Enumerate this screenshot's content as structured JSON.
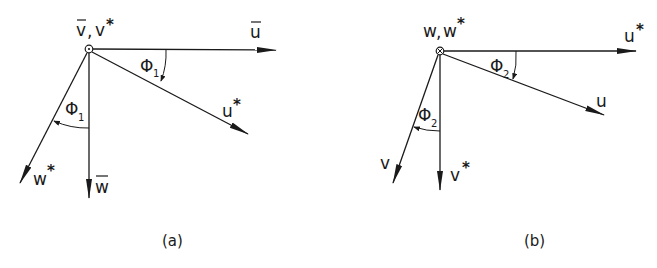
{
  "figure": {
    "panel_a": {
      "caption": "(a)",
      "origin_label_1": "v",
      "origin_label_sep": ",",
      "origin_label_2": "v",
      "origin_symbol": "dot-in-circle (axis out of page)",
      "vectors": [
        {
          "label": "u",
          "modifier": "bar",
          "direction": "horizontal-right"
        },
        {
          "label": "u",
          "modifier": "*",
          "direction": "rotated down-right by phi1"
        },
        {
          "label": "w",
          "modifier": "bar",
          "direction": "vertical-down"
        },
        {
          "label": "w",
          "modifier": "*",
          "direction": "rotated down-left by phi1"
        }
      ],
      "angles": [
        {
          "symbol": "Φ",
          "subscript": "1",
          "between": "u-bar and u*"
        },
        {
          "symbol": "Φ",
          "subscript": "1",
          "between": "w-bar and w*"
        }
      ],
      "labels": {
        "ubar": "u",
        "ustar": "u",
        "wbar": "w",
        "wstar": "w",
        "phi": "Φ",
        "phi_sub": "1",
        "star": "*"
      }
    },
    "panel_b": {
      "caption": "(b)",
      "origin_label_1": "w",
      "origin_label_sep": ",",
      "origin_label_2": "w",
      "origin_symbol": "cross-in-circle (axis into page)",
      "vectors": [
        {
          "label": "u",
          "modifier": "*",
          "direction": "horizontal-right"
        },
        {
          "label": "u",
          "modifier": "",
          "direction": "rotated down-right by phi2"
        },
        {
          "label": "v",
          "modifier": "*",
          "direction": "vertical-down"
        },
        {
          "label": "v",
          "modifier": "",
          "direction": "rotated down-left by phi2"
        }
      ],
      "angles": [
        {
          "symbol": "Φ",
          "subscript": "2",
          "between": "u* and u"
        },
        {
          "symbol": "Φ",
          "subscript": "2",
          "between": "v* and v"
        }
      ],
      "labels": {
        "ustar": "u",
        "u": "u",
        "vstar": "v",
        "v": "v",
        "phi": "Φ",
        "phi_sub": "2",
        "star": "*"
      }
    }
  }
}
